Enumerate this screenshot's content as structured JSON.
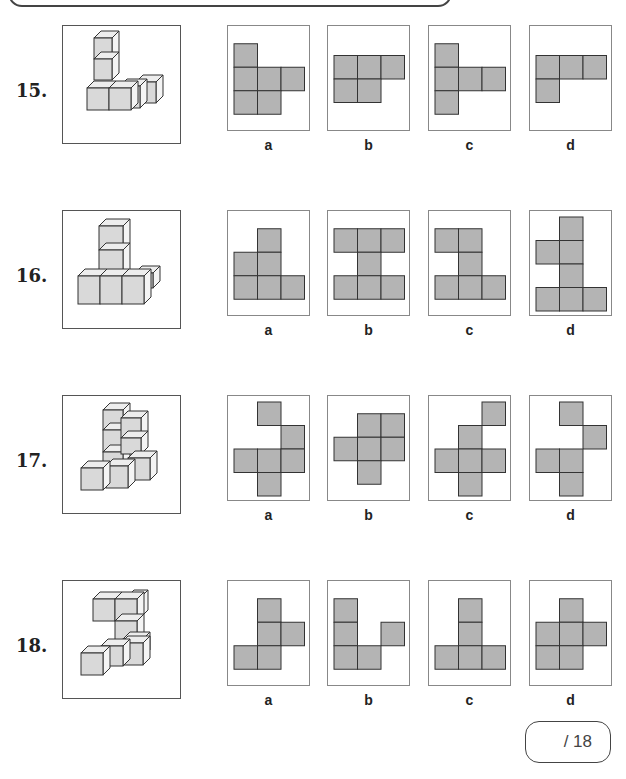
{
  "colors": {
    "net_fill": "#b4b4b4",
    "net_stroke": "#333333",
    "cube_face": "#d9d9d9",
    "cube_top": "#ededed",
    "cube_side": "#f4f4f4"
  },
  "questions": [
    {
      "number": "15.",
      "top": 25,
      "options": [
        {
          "label": "a",
          "cells": [
            [
              0,
              0
            ],
            [
              0,
              1
            ],
            [
              1,
              1
            ],
            [
              2,
              1
            ],
            [
              0,
              2
            ],
            [
              1,
              2
            ]
          ]
        },
        {
          "label": "b",
          "cells": [
            [
              0,
              0
            ],
            [
              1,
              0
            ],
            [
              2,
              0
            ],
            [
              0,
              1
            ],
            [
              1,
              1
            ]
          ]
        },
        {
          "label": "c",
          "cells": [
            [
              0,
              0
            ],
            [
              0,
              1
            ],
            [
              1,
              1
            ],
            [
              2,
              1
            ],
            [
              0,
              2
            ]
          ]
        },
        {
          "label": "d",
          "cells": [
            [
              0,
              0
            ],
            [
              1,
              0
            ],
            [
              2,
              0
            ],
            [
              0,
              1
            ]
          ]
        }
      ]
    },
    {
      "number": "16.",
      "top": 210,
      "options": [
        {
          "label": "a",
          "cells": [
            [
              1,
              0
            ],
            [
              0,
              1
            ],
            [
              1,
              1
            ],
            [
              0,
              2
            ],
            [
              1,
              2
            ],
            [
              2,
              2
            ]
          ]
        },
        {
          "label": "b",
          "cells": [
            [
              0,
              0
            ],
            [
              1,
              0
            ],
            [
              2,
              0
            ],
            [
              1,
              1
            ],
            [
              0,
              2
            ],
            [
              1,
              2
            ],
            [
              2,
              2
            ]
          ]
        },
        {
          "label": "c",
          "cells": [
            [
              0,
              0
            ],
            [
              1,
              0
            ],
            [
              1,
              1
            ],
            [
              0,
              2
            ],
            [
              1,
              2
            ],
            [
              2,
              2
            ]
          ]
        },
        {
          "label": "d",
          "cells": [
            [
              1,
              0
            ],
            [
              0,
              1
            ],
            [
              1,
              1
            ],
            [
              1,
              2
            ],
            [
              0,
              3
            ],
            [
              1,
              3
            ],
            [
              2,
              3
            ]
          ]
        }
      ]
    },
    {
      "number": "17.",
      "top": 395,
      "options": [
        {
          "label": "a",
          "cells": [
            [
              1,
              0
            ],
            [
              2,
              1
            ],
            [
              0,
              2
            ],
            [
              1,
              2
            ],
            [
              2,
              2
            ],
            [
              1,
              3
            ]
          ]
        },
        {
          "label": "b",
          "cells": [
            [
              1,
              0
            ],
            [
              2,
              0
            ],
            [
              0,
              1
            ],
            [
              1,
              1
            ],
            [
              2,
              1
            ],
            [
              1,
              2
            ]
          ]
        },
        {
          "label": "c",
          "cells": [
            [
              2,
              0
            ],
            [
              1,
              1
            ],
            [
              0,
              2
            ],
            [
              1,
              2
            ],
            [
              2,
              2
            ],
            [
              1,
              3
            ]
          ]
        },
        {
          "label": "d",
          "cells": [
            [
              1,
              0
            ],
            [
              2,
              1
            ],
            [
              0,
              2
            ],
            [
              1,
              2
            ],
            [
              1,
              3
            ]
          ]
        }
      ]
    },
    {
      "number": "18.",
      "top": 580,
      "options": [
        {
          "label": "a",
          "cells": [
            [
              1,
              0
            ],
            [
              1,
              1
            ],
            [
              2,
              1
            ],
            [
              0,
              2
            ],
            [
              1,
              2
            ]
          ]
        },
        {
          "label": "b",
          "cells": [
            [
              0,
              0
            ],
            [
              0,
              1
            ],
            [
              2,
              1
            ],
            [
              0,
              2
            ],
            [
              1,
              2
            ]
          ]
        },
        {
          "label": "c",
          "cells": [
            [
              1,
              0
            ],
            [
              1,
              1
            ],
            [
              0,
              2
            ],
            [
              1,
              2
            ],
            [
              2,
              2
            ]
          ]
        },
        {
          "label": "d",
          "cells": [
            [
              1,
              0
            ],
            [
              0,
              1
            ],
            [
              1,
              1
            ],
            [
              2,
              1
            ],
            [
              0,
              2
            ],
            [
              1,
              2
            ]
          ]
        }
      ]
    }
  ],
  "score": {
    "text": "/ 18"
  }
}
